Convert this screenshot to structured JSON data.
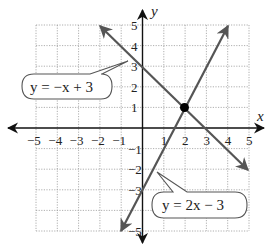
{
  "chart_data": {
    "type": "line",
    "title": "",
    "xlabel": "x",
    "ylabel": "y",
    "xlim": [
      -5,
      5
    ],
    "ylim": [
      -5,
      5
    ],
    "grid": true,
    "x_ticks": [
      "−5",
      "−4",
      "−3",
      "−2",
      "−1",
      "1",
      "2",
      "3",
      "4",
      "5"
    ],
    "y_ticks": [
      "5",
      "4",
      "3",
      "2",
      "1",
      "−1",
      "−2",
      "−3",
      "−5"
    ],
    "series": [
      {
        "name": "y = −x + 3",
        "equation": "y = −x + 3",
        "slope": -1,
        "intercept": 3,
        "x": [
          -2,
          5
        ],
        "y": [
          5,
          -2
        ]
      },
      {
        "name": "y = 2x − 3",
        "equation": "y = 2x − 3",
        "slope": 2,
        "intercept": -3,
        "x": [
          -1,
          4
        ],
        "y": [
          -5,
          5
        ]
      }
    ],
    "annotations": [
      {
        "type": "point",
        "x": 2,
        "y": 1,
        "label": "intersection"
      },
      {
        "type": "callout",
        "text": "y = −x + 3"
      },
      {
        "type": "callout",
        "text": "y = 2x − 3"
      }
    ]
  },
  "labels": {
    "x_axis": "x",
    "y_axis": "y",
    "line1_callout": "y = −x + 3",
    "line2_callout": "y = 2x − 3"
  },
  "colors": {
    "line": "#555555",
    "axis": "#111111",
    "grid": "#9a9a9a",
    "point": "#000000"
  }
}
